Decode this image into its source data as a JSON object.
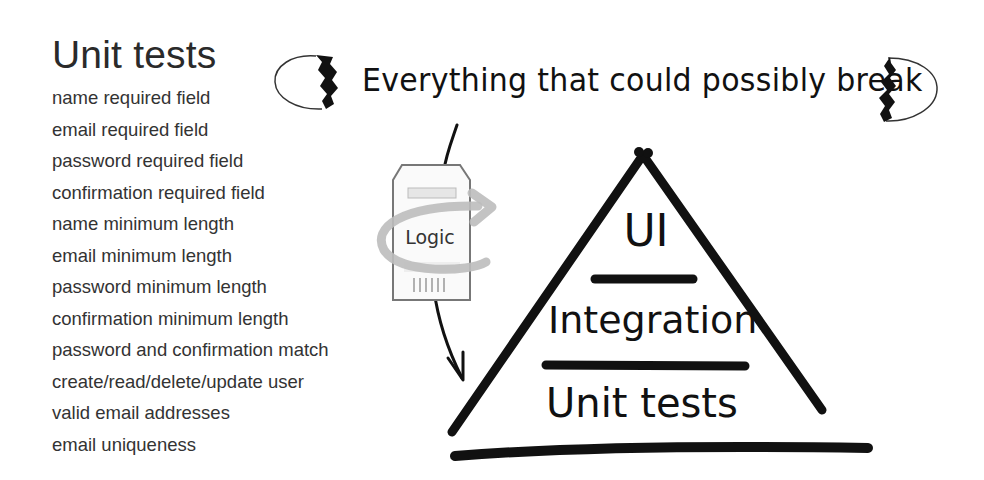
{
  "left_panel": {
    "title": "Unit tests",
    "items": [
      "name required field",
      "email required field",
      "password required field",
      "confirmation required field",
      "name minimum length",
      "email minimum length",
      "password minimum length",
      "confirmation minimum length",
      "password and confirmation match",
      "create/read/delete/update user",
      "valid email addresses",
      "email uniqueness"
    ]
  },
  "diagram": {
    "headline": "Everything that could possibly break",
    "decorations": [
      "broken-egg-shell-left-icon",
      "broken-egg-shell-right-icon"
    ],
    "logic_card": {
      "label": "Logic",
      "icon": "cycle-arrow-icon"
    },
    "pyramid": {
      "levels": [
        {
          "label": "UI"
        },
        {
          "label": "Integration"
        },
        {
          "label": "Unit tests"
        }
      ]
    },
    "colors": {
      "ink": "#111111",
      "card_border": "#777777",
      "cycle_arrow": "#bdbdbd"
    }
  }
}
